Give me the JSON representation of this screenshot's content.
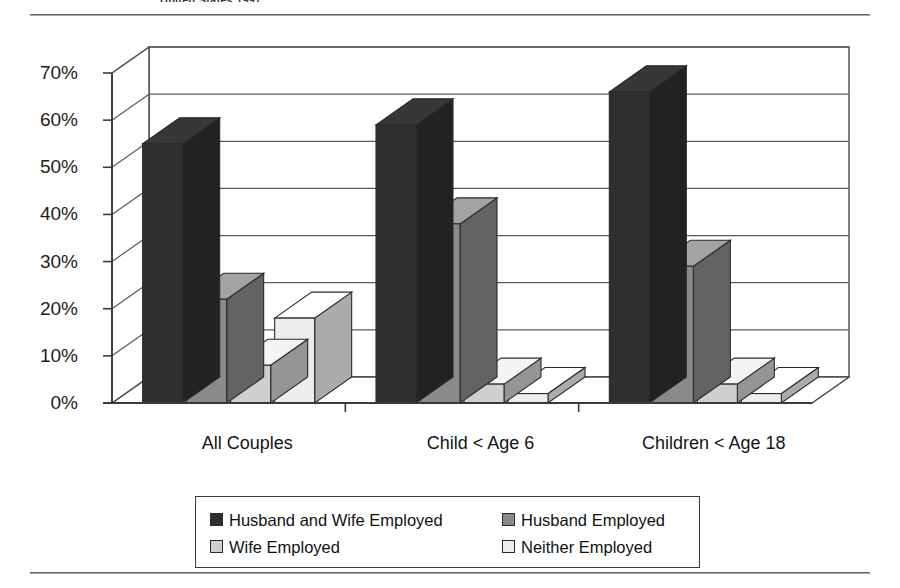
{
  "document": {
    "clipped_heading": "United States 1997"
  },
  "chart_data": {
    "type": "bar",
    "title": "",
    "subtitle": "",
    "xlabel": "",
    "ylabel": "",
    "ylim": [
      0,
      70
    ],
    "ytick_step": 10,
    "ytick_labels": [
      "0%",
      "10%",
      "20%",
      "30%",
      "40%",
      "50%",
      "60%",
      "70%"
    ],
    "ytick_values": [
      0,
      10,
      20,
      30,
      40,
      50,
      60,
      70
    ],
    "grid": true,
    "grid_axis": "y",
    "legend_position": "bottom",
    "three_d": true,
    "categories": [
      "All Couples",
      "Child < Age 6",
      "Children < Age 18"
    ],
    "series": [
      {
        "name": "Husband and Wife Employed",
        "color": "#2f2f2f",
        "values": [
          55,
          59,
          66
        ]
      },
      {
        "name": "Husband Employed",
        "color": "#8a8a8a",
        "values": [
          22,
          38,
          29
        ]
      },
      {
        "name": "Wife Employed",
        "color": "#cfcfcf",
        "values": [
          8,
          4,
          4
        ]
      },
      {
        "name": "Neither Employed",
        "color": "#ededed",
        "values": [
          18,
          2,
          2
        ]
      }
    ]
  },
  "legend": {
    "items": [
      {
        "label": "Husband and Wife Employed",
        "color": "#2f2f2f"
      },
      {
        "label": "Husband Employed",
        "color": "#8a8a8a"
      },
      {
        "label": "Wife Employed",
        "color": "#cfcfcf"
      },
      {
        "label": "Neither Employed",
        "color": "#ededed"
      }
    ]
  }
}
